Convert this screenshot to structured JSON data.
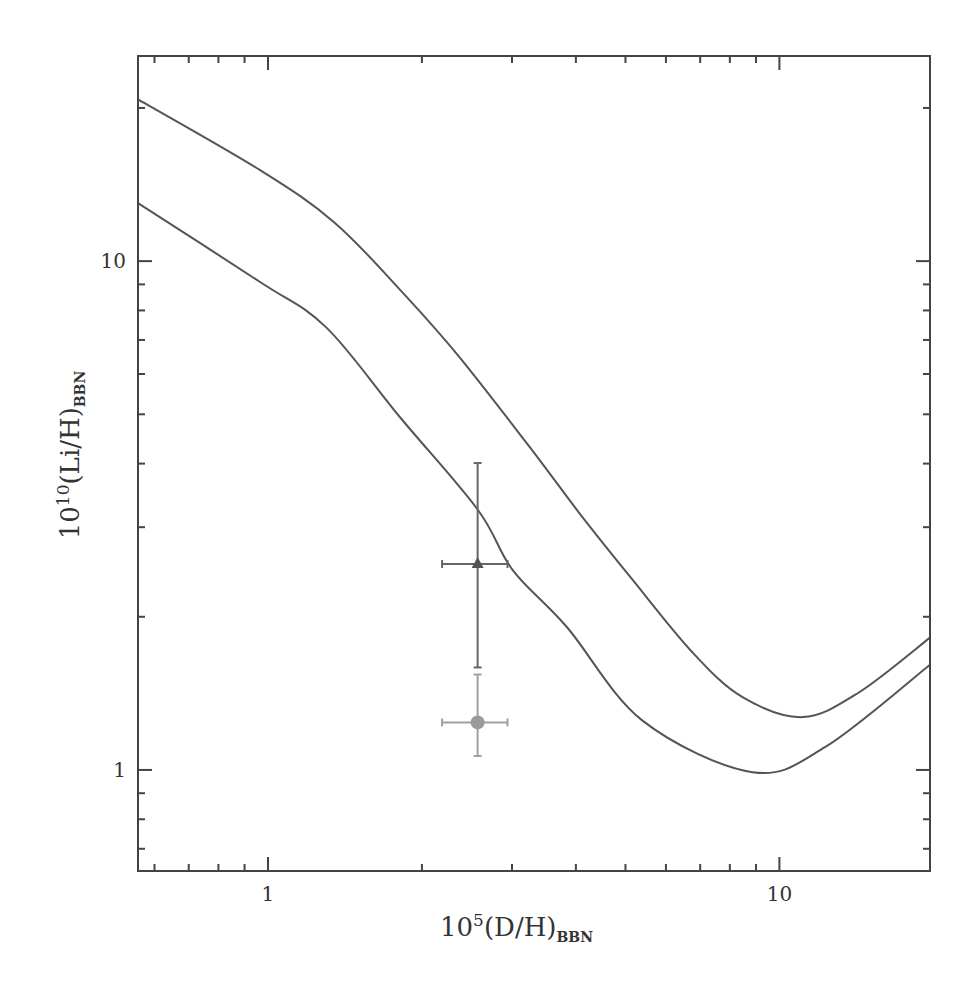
{
  "chart_data": {
    "type": "line",
    "title": "",
    "xlabel": {
      "prefix": "10",
      "sup": "5",
      "main": "(D/H)",
      "sub": "BBN"
    },
    "ylabel": {
      "prefix": "10",
      "sup": "10",
      "main": "(Li/H)",
      "sub": "BBN"
    },
    "xscale": "log",
    "yscale": "log",
    "xlim": [
      0.557,
      19.7
    ],
    "ylim": [
      0.633,
      25.3
    ],
    "grid": false,
    "legend": null,
    "x_major_ticks": [
      {
        "value": 1,
        "label": "1"
      },
      {
        "value": 10,
        "label": "10"
      }
    ],
    "y_major_ticks": [
      {
        "value": 1,
        "label": "1"
      },
      {
        "value": 10,
        "label": "10"
      }
    ],
    "x_minor_ticks": [
      0.6,
      0.7,
      0.8,
      0.9,
      2,
      3,
      4,
      5,
      6,
      7,
      8,
      9
    ],
    "y_minor_ticks": [
      0.7,
      0.8,
      0.9,
      2,
      3,
      4,
      5,
      6,
      7,
      8,
      9,
      20
    ],
    "series": [
      {
        "name": "upper bound",
        "style": "line",
        "color": "#555555",
        "x": [
          0.557,
          0.965,
          1.35,
          1.83,
          2.37,
          3.25,
          4.07,
          5.17,
          6.77,
          8.47,
          11.1,
          14.3,
          19.7
        ],
        "y": [
          20.8,
          15.1,
          11.9,
          8.69,
          6.47,
          4.31,
          3.19,
          2.36,
          1.7,
          1.39,
          1.27,
          1.42,
          1.82
        ]
      },
      {
        "name": "lower bound",
        "style": "line",
        "color": "#555555",
        "x": [
          0.557,
          0.965,
          1.3,
          1.81,
          2.57,
          3.01,
          3.84,
          5.4,
          8.86,
          12.3,
          19.7
        ],
        "y": [
          13.0,
          9.1,
          7.41,
          4.94,
          3.25,
          2.47,
          1.91,
          1.25,
          0.99,
          1.11,
          1.61
        ]
      }
    ],
    "points": [
      {
        "name": "triangle point",
        "marker": "triangle",
        "color": "#555555",
        "errcolor": "#666666",
        "x": 2.57,
        "y": 2.54,
        "xerr": [
          2.19,
          2.94
        ],
        "yerr": [
          1.59,
          4.01
        ]
      },
      {
        "name": "circle point",
        "marker": "circle",
        "color": "#9a9a9a",
        "errcolor": "#a0a0a0",
        "x": 2.57,
        "y": 1.24,
        "xerr": [
          2.19,
          2.94
        ],
        "yerr": [
          1.065,
          1.54
        ]
      }
    ]
  }
}
